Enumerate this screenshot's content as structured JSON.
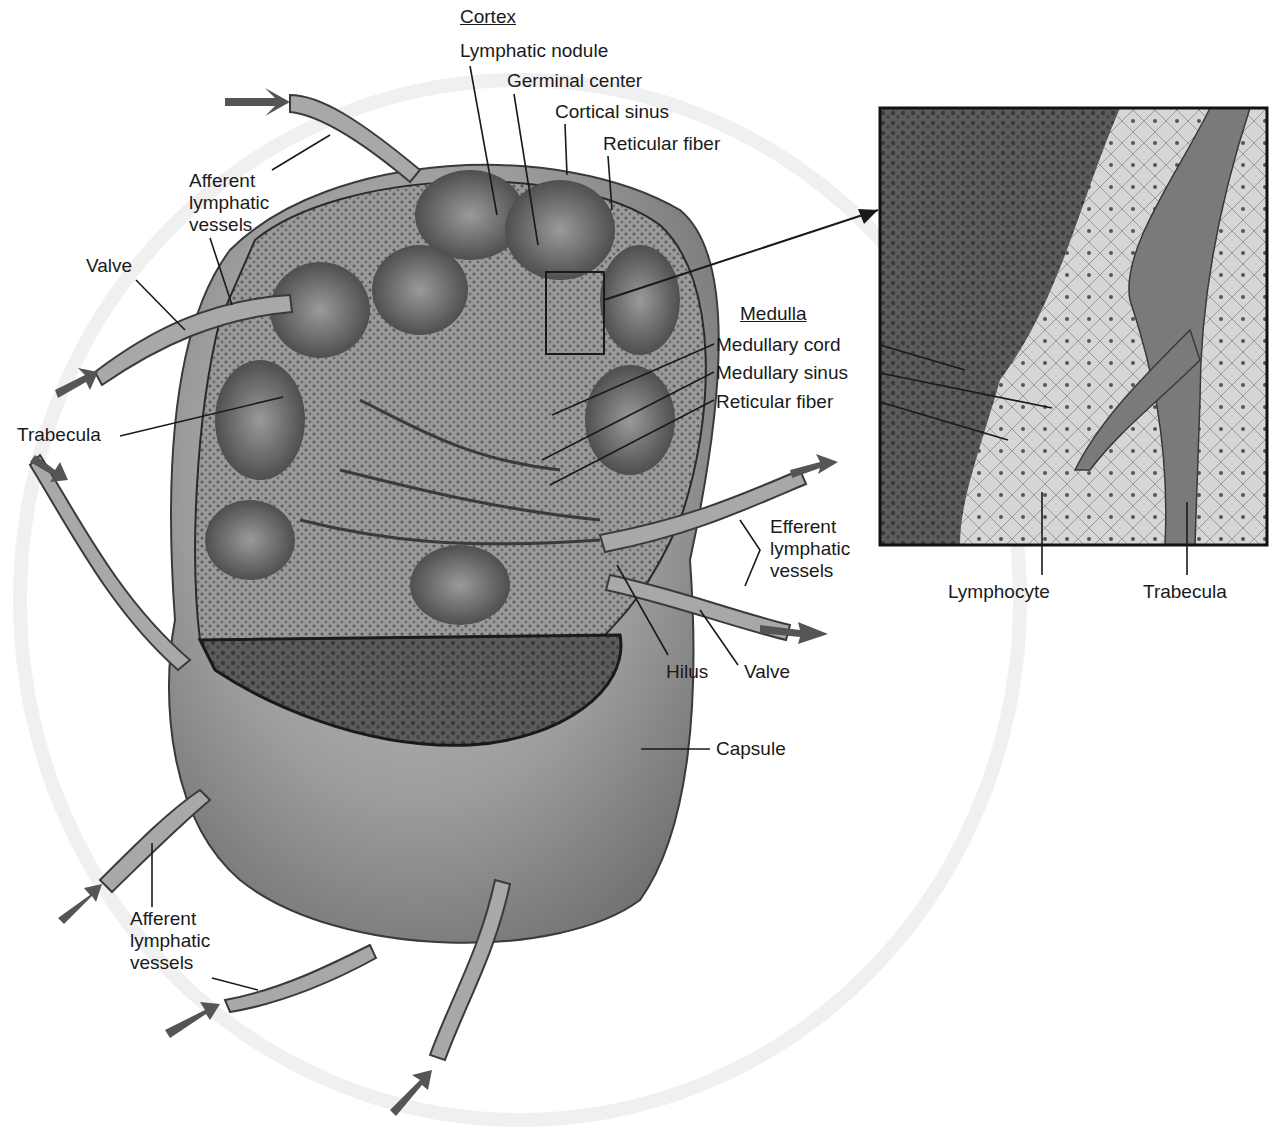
{
  "diagram": {
    "sections": {
      "cortex": {
        "heading": "Cortex",
        "labels": [
          "Lymphatic nodule",
          "Germinal center",
          "Cortical sinus",
          "Reticular fiber"
        ]
      },
      "medulla": {
        "heading": "Medulla",
        "labels": [
          "Medullary cord",
          "Medullary sinus",
          "Reticular fiber"
        ]
      }
    },
    "left_labels": {
      "afferent_top": [
        "Afferent",
        "lymphatic",
        "vessels"
      ],
      "valve": "Valve",
      "trabecula": "Trabecula",
      "afferent_bottom": [
        "Afferent",
        "lymphatic",
        "vessels"
      ]
    },
    "right_labels": {
      "efferent": [
        "Efferent",
        "lymphatic",
        "vessels"
      ],
      "hilus": "Hilus",
      "valve": "Valve",
      "capsule": "Capsule"
    },
    "inset": {
      "description": "Magnified histology of boxed cortex region",
      "labels": {
        "lymphocyte": "Lymphocyte",
        "trabecula": "Trabecula"
      }
    },
    "colors": {
      "ink": "#1a1a1a",
      "capsule": "#8c8c8c",
      "tissue_dark": "#4a4a4a",
      "tissue_light": "#bdbdbd",
      "background": "#ffffff"
    }
  }
}
